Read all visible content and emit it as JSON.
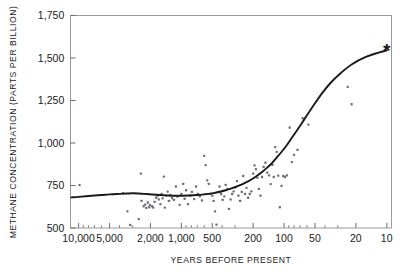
{
  "figure": {
    "background_color": "#ffffff",
    "frame_color": "#9a9a9a",
    "ink_color": "#1a1a1a",
    "point_color": "#6e6e78",
    "curve_color": "#1a1a1a"
  },
  "chart_data": {
    "type": "scatter",
    "title": "",
    "subtitle": "",
    "xlabel": "YEARS BEFORE PRESENT",
    "ylabel": "METHANE CONCENTRATION (PARTS PER BILLION)",
    "x_scale": "log-reversed",
    "y_scale": "linear",
    "xlim": [
      12000,
      9
    ],
    "ylim": [
      500,
      1750
    ],
    "grid": false,
    "legend": null,
    "x_tick_labels": [
      "10,000",
      "5,000",
      "2,000",
      "1,000",
      "500",
      "200",
      "100",
      "50",
      "20",
      "10"
    ],
    "x_tick_values": [
      10000,
      5000,
      2000,
      1000,
      500,
      200,
      100,
      50,
      20,
      10
    ],
    "y_tick_labels": [
      "1,750",
      "1,500",
      "1,250",
      "1,000",
      "750",
      "500"
    ],
    "y_tick_values": [
      1750,
      1500,
      1250,
      1000,
      750,
      500
    ],
    "annotations": [
      {
        "name": "present-day-marker",
        "symbol": "*",
        "x": 10,
        "y": 1545
      }
    ],
    "series": [
      {
        "name": "Ice-core methane measurements",
        "type": "scatter",
        "marker": "small-square",
        "points": [
          [
            9800,
            752
          ],
          [
            3700,
            705
          ],
          [
            3350,
            598
          ],
          [
            3150,
            518
          ],
          [
            2600,
            552
          ],
          [
            2480,
            820
          ],
          [
            2440,
            660
          ],
          [
            2330,
            628
          ],
          [
            2250,
            638
          ],
          [
            2200,
            618
          ],
          [
            2120,
            650
          ],
          [
            2060,
            622
          ],
          [
            2020,
            636
          ],
          [
            1930,
            628
          ],
          [
            1880,
            620
          ],
          [
            1820,
            654
          ],
          [
            1760,
            678
          ],
          [
            1700,
            690
          ],
          [
            1660,
            668
          ],
          [
            1600,
            640
          ],
          [
            1560,
            700
          ],
          [
            1520,
            674
          ],
          [
            1480,
            802
          ],
          [
            1450,
            620
          ],
          [
            1400,
            690
          ],
          [
            1360,
            714
          ],
          [
            1320,
            660
          ],
          [
            1280,
            694
          ],
          [
            1230,
            676
          ],
          [
            1180,
            666
          ],
          [
            1130,
            744
          ],
          [
            1090,
            684
          ],
          [
            1040,
            636
          ],
          [
            1000,
            700
          ],
          [
            960,
            760
          ],
          [
            930,
            672
          ],
          [
            900,
            722
          ],
          [
            860,
            640
          ],
          [
            820,
            690
          ],
          [
            790,
            712
          ],
          [
            750,
            670
          ],
          [
            720,
            744
          ],
          [
            690,
            700
          ],
          [
            660,
            686
          ],
          [
            630,
            662
          ],
          [
            600,
            924
          ],
          [
            580,
            870
          ],
          [
            560,
            780
          ],
          [
            540,
            760
          ],
          [
            520,
            702
          ],
          [
            500,
            690
          ],
          [
            485,
            660
          ],
          [
            470,
            598
          ],
          [
            455,
            520
          ],
          [
            440,
            712
          ],
          [
            425,
            744
          ],
          [
            410,
            700
          ],
          [
            396,
            666
          ],
          [
            382,
            686
          ],
          [
            370,
            754
          ],
          [
            356,
            730
          ],
          [
            344,
            612
          ],
          [
            332,
            668
          ],
          [
            320,
            700
          ],
          [
            310,
            716
          ],
          [
            298,
            740
          ],
          [
            288,
            776
          ],
          [
            278,
            690
          ],
          [
            268,
            660
          ],
          [
            258,
            712
          ],
          [
            250,
            806
          ],
          [
            240,
            700
          ],
          [
            232,
            736
          ],
          [
            224,
            678
          ],
          [
            216,
            700
          ],
          [
            208,
            716
          ],
          [
            200,
            820
          ],
          [
            194,
            868
          ],
          [
            188,
            846
          ],
          [
            182,
            796
          ],
          [
            176,
            730
          ],
          [
            170,
            690
          ],
          [
            164,
            800
          ],
          [
            158,
            860
          ],
          [
            152,
            884
          ],
          [
            146,
            826
          ],
          [
            140,
            810
          ],
          [
            135,
            758
          ],
          [
            130,
            872
          ],
          [
            126,
            800
          ],
          [
            122,
            976
          ],
          [
            118,
            948
          ],
          [
            114,
            808
          ],
          [
            110,
            622
          ],
          [
            106,
            748
          ],
          [
            102,
            806
          ],
          [
            98,
            800
          ],
          [
            94,
            810
          ],
          [
            88,
            1090
          ],
          [
            84,
            888
          ],
          [
            80,
            930
          ],
          [
            74,
            960
          ],
          [
            66,
            1146
          ],
          [
            58,
            1108
          ],
          [
            24,
            1330
          ],
          [
            22,
            1228
          ]
        ]
      },
      {
        "name": "Fitted trend",
        "type": "line",
        "points": [
          [
            11800,
            680
          ],
          [
            10000,
            683
          ],
          [
            8000,
            688
          ],
          [
            6000,
            694
          ],
          [
            5000,
            698
          ],
          [
            4000,
            701
          ],
          [
            3400,
            703
          ],
          [
            3000,
            704
          ],
          [
            2600,
            703
          ],
          [
            2200,
            700
          ],
          [
            1900,
            697
          ],
          [
            1600,
            694
          ],
          [
            1400,
            692
          ],
          [
            1200,
            690
          ],
          [
            1000,
            690
          ],
          [
            850,
            691
          ],
          [
            700,
            694
          ],
          [
            600,
            698
          ],
          [
            500,
            704
          ],
          [
            430,
            712
          ],
          [
            370,
            722
          ],
          [
            320,
            734
          ],
          [
            280,
            748
          ],
          [
            240,
            766
          ],
          [
            210,
            784
          ],
          [
            185,
            806
          ],
          [
            165,
            828
          ],
          [
            148,
            852
          ],
          [
            132,
            880
          ],
          [
            118,
            914
          ],
          [
            105,
            950
          ],
          [
            95,
            984
          ],
          [
            85,
            1026
          ],
          [
            75,
            1074
          ],
          [
            66,
            1124
          ],
          [
            58,
            1176
          ],
          [
            50,
            1234
          ],
          [
            42,
            1298
          ],
          [
            35,
            1356
          ],
          [
            28,
            1412
          ],
          [
            22,
            1462
          ],
          [
            16,
            1506
          ],
          [
            12,
            1532
          ],
          [
            10,
            1545
          ]
        ]
      }
    ]
  }
}
